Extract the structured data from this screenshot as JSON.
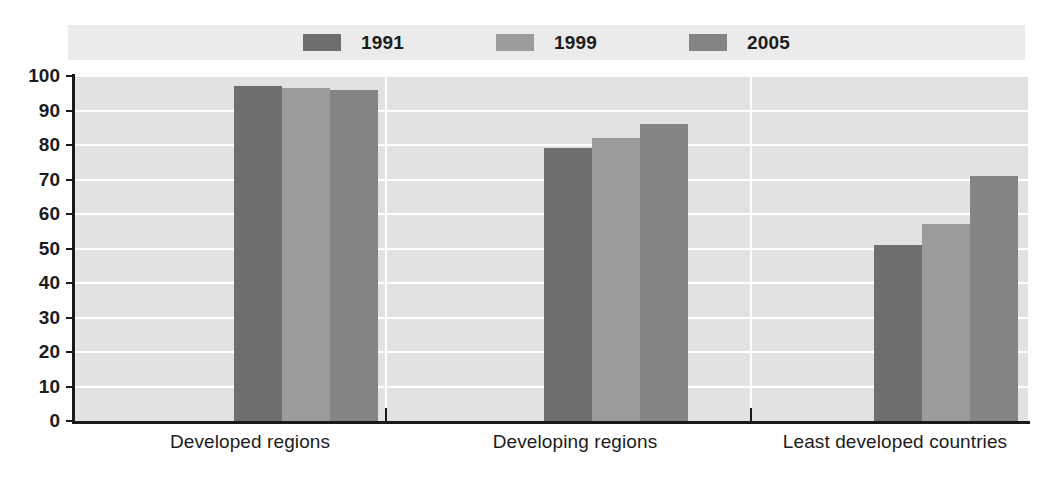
{
  "chart_data": {
    "type": "bar",
    "title": "",
    "subtitle": "",
    "xlabel": "",
    "ylabel": "",
    "ylim": [
      0,
      100
    ],
    "ytick_step": 10,
    "yticks": [
      100,
      90,
      80,
      70,
      60,
      50,
      40,
      30,
      20,
      10,
      0
    ],
    "grid": true,
    "legend_position": "top",
    "categories": [
      "Developed regions",
      "Developing regions",
      "Least developed countries"
    ],
    "series": [
      {
        "name": "1991",
        "color": "#6e6e6e",
        "values": [
          97,
          79,
          51
        ]
      },
      {
        "name": "1999",
        "color": "#9b9b9b",
        "values": [
          96.5,
          82,
          57
        ]
      },
      {
        "name": "2005",
        "color": "#848484",
        "values": [
          96,
          86,
          71
        ]
      }
    ]
  },
  "legend": {
    "items": [
      {
        "label": "1991",
        "color": "#6e6e6e"
      },
      {
        "label": "1999",
        "color": "#9b9b9b"
      },
      {
        "label": "2005",
        "color": "#848484"
      }
    ]
  },
  "axis": {
    "y_labels": [
      "100",
      "90",
      "80",
      "70",
      "60",
      "50",
      "40",
      "30",
      "20",
      "10",
      "0"
    ]
  },
  "colors": {
    "plot_background": "#e2e2e2",
    "legend_background": "#ebebeb",
    "gridline": "#ffffff",
    "axis": "#1a1a1a",
    "text": "#1c1c1c",
    "series_1991": "#6e6e6e",
    "series_1999": "#9b9b9b",
    "series_2005": "#848484"
  }
}
